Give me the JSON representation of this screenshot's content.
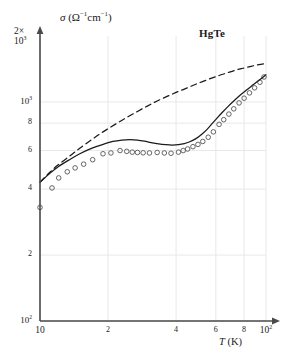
{
  "figure": {
    "sample_label": "HgTe",
    "y_axis": {
      "caption_sigma": "σ",
      "caption_units": "(Ω",
      "caption_units_exp1": "−1",
      "caption_units_mid": "cm",
      "caption_units_exp2": "−1",
      "caption_units_close": ")",
      "top_multiplier": "2×",
      "top_base": "10",
      "top_exponent": "3",
      "ticks": [
        {
          "label": "10",
          "exponent": "3",
          "value": 1000
        },
        {
          "label": "8",
          "exponent": "",
          "value": 800
        },
        {
          "label": "6",
          "exponent": "",
          "value": 600
        },
        {
          "label": "4",
          "exponent": "",
          "value": 400
        },
        {
          "label": "2",
          "exponent": "",
          "value": 200
        },
        {
          "label": "10",
          "exponent": "2",
          "value": 100
        }
      ],
      "min": 100,
      "max": 2000,
      "scale": "log"
    },
    "x_axis": {
      "label_var": "T",
      "label_units": "(K)",
      "ticks": [
        {
          "label": "10",
          "exponent": "",
          "value": 10
        },
        {
          "label": "2",
          "exponent": "",
          "value": 20
        },
        {
          "label": "4",
          "exponent": "",
          "value": 40
        },
        {
          "label": "6",
          "exponent": "",
          "value": 60
        },
        {
          "label": "8",
          "exponent": "",
          "value": 80
        },
        {
          "label": "10",
          "exponent": "2",
          "value": 100
        }
      ],
      "min": 10,
      "max": 100,
      "scale": "log"
    },
    "colors": {
      "axis": "#4a4a4a",
      "grid": "#e8e8e8",
      "curve": "#1a1a1a",
      "marker": "#555555"
    }
  },
  "chart_data": {
    "type": "line",
    "title": "",
    "subtitle": "",
    "xlabel": "T (K)",
    "ylabel": "σ (Ω−1cm−1)",
    "xscale": "log",
    "yscale": "log",
    "xlim": [
      10,
      100
    ],
    "ylim": [
      100,
      2000
    ],
    "grid": true,
    "legend": false,
    "annotations": [
      {
        "text": "HgTe",
        "x": 62,
        "y": 1700
      }
    ],
    "series": [
      {
        "name": "experimental data",
        "type": "scatter",
        "marker": "open-circle",
        "points": [
          [
            10.0,
            330
          ],
          [
            11.3,
            405
          ],
          [
            12.1,
            450
          ],
          [
            13.2,
            480
          ],
          [
            14.3,
            500
          ],
          [
            15.6,
            520
          ],
          [
            17.1,
            545
          ],
          [
            19.0,
            580
          ],
          [
            20.6,
            585
          ],
          [
            22.6,
            600
          ],
          [
            24.2,
            595
          ],
          [
            25.6,
            590
          ],
          [
            27.0,
            588
          ],
          [
            28.6,
            586
          ],
          [
            30.5,
            585
          ],
          [
            33.0,
            588
          ],
          [
            35.5,
            585
          ],
          [
            38.0,
            583
          ],
          [
            41.0,
            590
          ],
          [
            43.0,
            600
          ],
          [
            45.0,
            610
          ],
          [
            47.5,
            625
          ],
          [
            50.0,
            640
          ],
          [
            52.5,
            660
          ],
          [
            55.5,
            690
          ],
          [
            58.5,
            730
          ],
          [
            62.0,
            790
          ],
          [
            65.0,
            830
          ],
          [
            68.5,
            880
          ],
          [
            72.0,
            930
          ],
          [
            76.0,
            990
          ],
          [
            80.0,
            1040
          ],
          [
            84.5,
            1100
          ],
          [
            89.0,
            1160
          ],
          [
            94.0,
            1230
          ],
          [
            98.0,
            1300
          ]
        ]
      },
      {
        "name": "theory - solid",
        "type": "line",
        "style": "solid",
        "points": [
          [
            10.0,
            430
          ],
          [
            11.0,
            470
          ],
          [
            12.0,
            505
          ],
          [
            13.5,
            545
          ],
          [
            15.0,
            580
          ],
          [
            17.0,
            615
          ],
          [
            19.0,
            640
          ],
          [
            21.0,
            660
          ],
          [
            23.0,
            670
          ],
          [
            25.0,
            673
          ],
          [
            27.0,
            670
          ],
          [
            29.0,
            662
          ],
          [
            31.0,
            652
          ],
          [
            33.5,
            643
          ],
          [
            36.0,
            638
          ],
          [
            38.5,
            636
          ],
          [
            41.0,
            638
          ],
          [
            43.5,
            645
          ],
          [
            46.0,
            658
          ],
          [
            49.0,
            680
          ],
          [
            52.0,
            712
          ],
          [
            55.0,
            752
          ],
          [
            58.0,
            800
          ],
          [
            61.0,
            848
          ],
          [
            64.0,
            895
          ],
          [
            68.0,
            955
          ],
          [
            72.0,
            1010
          ],
          [
            77.0,
            1075
          ],
          [
            82.0,
            1135
          ],
          [
            88.0,
            1200
          ],
          [
            94.0,
            1265
          ],
          [
            100.0,
            1330
          ]
        ]
      },
      {
        "name": "theory - dashed",
        "type": "line",
        "style": "dashed",
        "points": [
          [
            10.0,
            430
          ],
          [
            11.0,
            475
          ],
          [
            12.0,
            515
          ],
          [
            13.5,
            565
          ],
          [
            15.0,
            615
          ],
          [
            17.0,
            675
          ],
          [
            19.0,
            730
          ],
          [
            21.5,
            790
          ],
          [
            24.0,
            845
          ],
          [
            27.0,
            905
          ],
          [
            30.0,
            960
          ],
          [
            33.0,
            1010
          ],
          [
            36.5,
            1060
          ],
          [
            40.0,
            1105
          ],
          [
            44.0,
            1150
          ],
          [
            48.0,
            1195
          ],
          [
            52.0,
            1235
          ],
          [
            57.0,
            1280
          ],
          [
            62.0,
            1320
          ],
          [
            67.0,
            1355
          ],
          [
            73.0,
            1395
          ],
          [
            79.0,
            1425
          ],
          [
            86.0,
            1455
          ],
          [
            93.0,
            1480
          ],
          [
            100.0,
            1500
          ]
        ]
      }
    ]
  }
}
